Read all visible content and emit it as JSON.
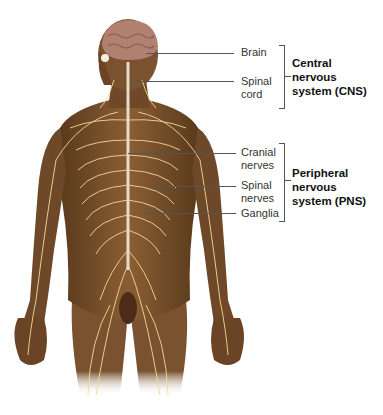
{
  "figure": {
    "colors": {
      "skin": "#7a5230",
      "skin_dark": "#4e3118",
      "nerve": "#f0dc9a",
      "brain": "#b08070",
      "background": "#ffffff",
      "leader_line": "#555555"
    }
  },
  "labels": {
    "brain": "Brain",
    "spinal_cord_1": "Spinal",
    "spinal_cord_2": "cord",
    "cranial_nerves_1": "Cranial",
    "cranial_nerves_2": "nerves",
    "spinal_nerves_1": "Spinal",
    "spinal_nerves_2": "nerves",
    "ganglia": "Ganglia"
  },
  "groups": {
    "cns": {
      "line1": "Central",
      "line2": "nervous",
      "line3": "system (CNS)"
    },
    "pns": {
      "line1": "Peripheral",
      "line2": "nervous",
      "line3": "system (PNS)"
    }
  }
}
